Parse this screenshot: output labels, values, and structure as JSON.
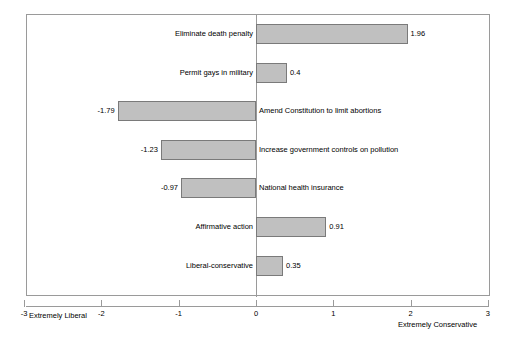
{
  "chart_data": {
    "type": "bar",
    "orientation": "horizontal",
    "title": "",
    "subtitle": "",
    "xlabel": "",
    "ylabel": "",
    "xlim": [
      -3,
      3
    ],
    "xticks": [
      -3,
      -2,
      -1,
      0,
      1,
      2,
      3
    ],
    "xtick_labels": [
      "-3",
      "-2",
      "-1",
      "0",
      "1",
      "2",
      "3"
    ],
    "grid": false,
    "legend": false,
    "zero_line": 0,
    "axis_end_labels": {
      "left": "Extremely Liberal",
      "right": "Extremely Conservative"
    },
    "bar_style": {
      "fill": "#c0c0c0",
      "border": "#7a7a7a"
    },
    "categories": [
      "Eliminate death penalty",
      "Permit gays in military",
      "Amend Constitution to limit abortions",
      "Increase government controls on pollution",
      "National health insurance",
      "Affirmative action",
      "Liberal-conservative"
    ],
    "values": [
      1.96,
      0.4,
      -1.79,
      -1.23,
      -0.97,
      0.91,
      0.35
    ],
    "value_labels": [
      "1.96",
      "0.4",
      "-1.79",
      "-1.23",
      "-0.97",
      "0.91",
      "0.35"
    ],
    "bars": [
      {
        "category": "Eliminate death penalty",
        "value": 1.96,
        "value_label": "1.96",
        "row": 0
      },
      {
        "category": "Permit gays in military",
        "value": 0.4,
        "value_label": "0.4",
        "row": 1
      },
      {
        "category": "Amend Constitution to limit abortions",
        "value": -1.79,
        "value_label": "-1.79",
        "row": 2
      },
      {
        "category": "Increase government controls on pollution",
        "value": -1.23,
        "value_label": "-1.23",
        "row": 3
      },
      {
        "category": "National health insurance",
        "value": -0.97,
        "value_label": "-0.97",
        "row": 4
      },
      {
        "category": "Affirmative action",
        "value": 0.91,
        "value_label": "0.91",
        "row": 5
      },
      {
        "category": "Liberal-conservative",
        "value": 0.35,
        "value_label": "0.35",
        "row": 6
      }
    ]
  }
}
